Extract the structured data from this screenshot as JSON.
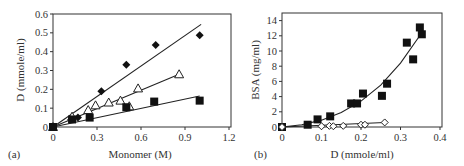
{
  "panels": {
    "a": {
      "tag": "(a)",
      "xlabel": "Monomer (M)",
      "ylabel": "D (mmole/ml)"
    },
    "b": {
      "tag": "(b)",
      "xlabel": "D (mmole/ml)",
      "ylabel": "BSA (mg/ml)"
    }
  },
  "chart_data": [
    {
      "type": "scatter",
      "panel": "(a)",
      "title": "",
      "xlabel": "Monomer (M)",
      "ylabel": "D (mmole/ml)",
      "xlim": [
        0,
        1.2
      ],
      "ylim": [
        0,
        0.6
      ],
      "xticks": [
        "0",
        "0.3",
        "0.6",
        "0.9",
        "1.2"
      ],
      "yticks": [
        "0",
        "0.1",
        "0.2",
        "0.3",
        "0.4",
        "0.5",
        "0.6"
      ],
      "grid": false,
      "legend": null,
      "series": [
        {
          "name": "filled diamonds",
          "marker": "diamond-filled",
          "x": [
            0,
            0.17,
            0.33,
            0.5,
            0.7,
            1.0
          ],
          "y": [
            0,
            0.05,
            0.19,
            0.33,
            0.435,
            0.487
          ],
          "fit": {
            "type": "linear",
            "x": [
              0,
              1.01
            ],
            "y": [
              0,
              0.545
            ]
          }
        },
        {
          "name": "open triangles",
          "marker": "triangle-open",
          "x": [
            0,
            0.13,
            0.24,
            0.29,
            0.38,
            0.46,
            0.52,
            0.58,
            0.86
          ],
          "y": [
            0,
            0.055,
            0.09,
            0.115,
            0.13,
            0.14,
            0.11,
            0.205,
            0.28
          ],
          "fit": {
            "type": "linear",
            "x": [
              0,
              0.86
            ],
            "y": [
              0,
              0.28
            ]
          }
        },
        {
          "name": "filled squares",
          "marker": "square-filled",
          "x": [
            0,
            0.13,
            0.25,
            0.5,
            0.69,
            1.0
          ],
          "y": [
            0,
            0.04,
            0.05,
            0.105,
            0.135,
            0.14
          ],
          "fit": {
            "type": "linear",
            "x": [
              0,
              1.0
            ],
            "y": [
              0,
              0.165
            ]
          }
        }
      ]
    },
    {
      "type": "scatter",
      "panel": "(b)",
      "title": "",
      "xlabel": "D (mmole/ml)",
      "ylabel": "BSA (mg/ml)",
      "xlim": [
        0,
        0.4
      ],
      "ylim": [
        0,
        15
      ],
      "xticks": [
        "0",
        "0.1",
        "0.2",
        "0.3",
        "0.4"
      ],
      "yticks": [
        "0",
        "2",
        "4",
        "6",
        "8",
        "10",
        "12",
        "14"
      ],
      "grid": false,
      "legend": null,
      "series": [
        {
          "name": "filled squares",
          "marker": "square-filled",
          "x": [
            0,
            0.065,
            0.09,
            0.122,
            0.175,
            0.19,
            0.205,
            0.253,
            0.266,
            0.316,
            0.332,
            0.349,
            0.354
          ],
          "y": [
            0,
            0.3,
            1.0,
            1.4,
            3.1,
            3.1,
            4.4,
            4.1,
            5.7,
            11.1,
            8.9,
            13.1,
            12.2
          ],
          "fit": {
            "type": "exponential-like curve",
            "x": [
              0,
              0.05,
              0.1,
              0.15,
              0.2,
              0.25,
              0.3,
              0.35
            ],
            "y": [
              0,
              0.3,
              0.9,
              1.9,
              3.4,
              5.5,
              8.4,
              12.1
            ]
          }
        },
        {
          "name": "open diamonds",
          "marker": "diamond-open",
          "x": [
            0,
            0.1,
            0.12,
            0.13,
            0.155,
            0.2,
            0.21,
            0.26
          ],
          "y": [
            0,
            0.1,
            0.15,
            0.1,
            0.15,
            0.3,
            0.3,
            0.6
          ],
          "fit": {
            "type": "linear",
            "x": [
              0,
              0.26
            ],
            "y": [
              0,
              0.6
            ]
          }
        }
      ]
    }
  ]
}
